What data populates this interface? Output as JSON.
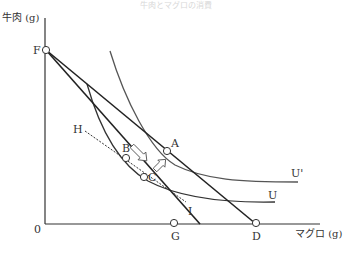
{
  "caption": "牛肉とマグロの消費",
  "axes": {
    "y_label": "牛肉 (g)",
    "x_label": "マグロ (g)",
    "origin_label": "0"
  },
  "points": {
    "F": "F",
    "A": "A",
    "B": "B",
    "C": "C",
    "D": "D",
    "G": "G",
    "H": "H",
    "I": "I"
  },
  "curves": {
    "u_prime": "U'",
    "u": "U"
  },
  "colors": {
    "line": "#222222",
    "curve": "#444444",
    "arrow": "#555555"
  }
}
